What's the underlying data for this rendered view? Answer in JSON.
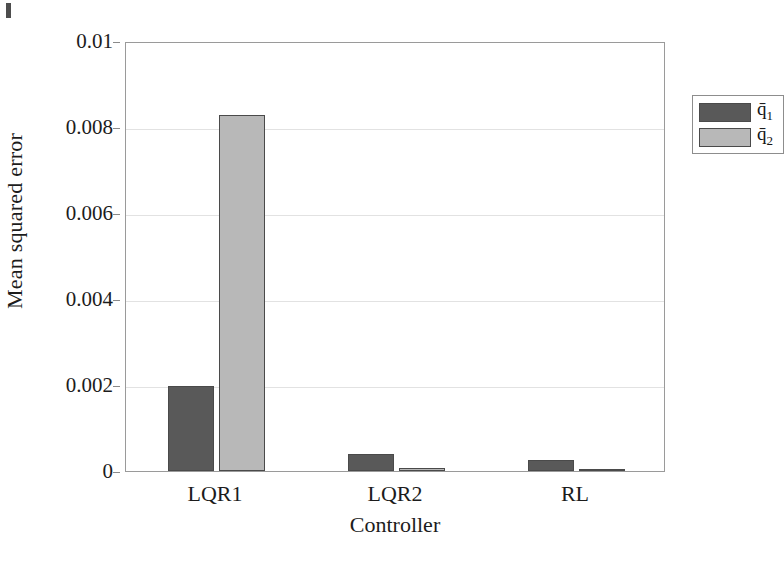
{
  "chart_data": {
    "type": "bar",
    "title": "",
    "subtitle": "",
    "xlabel": "Controller",
    "ylabel": "Mean squared error",
    "categories": [
      "LQR1",
      "LQR2",
      "RL"
    ],
    "series": [
      {
        "name": "q̅1",
        "label_base": "q̄",
        "label_sub": "1",
        "color": "#595959",
        "values": [
          0.00198,
          0.0004,
          0.00025
        ]
      },
      {
        "name": "q̅2",
        "label_base": "q̄",
        "label_sub": "2",
        "color": "#b8b8b8",
        "values": [
          0.00828,
          8e-05,
          5e-05
        ]
      }
    ],
    "ylim": [
      0,
      0.01
    ],
    "xlim_note": "categorical",
    "yticks": [
      0,
      0.002,
      0.004,
      0.006,
      0.008,
      0.01
    ],
    "ytick_labels": [
      "0",
      "0.002",
      "0.004",
      "0.006",
      "0.008",
      "0.01"
    ],
    "grid": true,
    "grid_axis": "y",
    "legend_position": "top-right",
    "legend_entries": [
      "q̄1",
      "q̄2"
    ]
  },
  "axes": {
    "y_title": "Mean squared error",
    "x_title": "Controller",
    "y_tick_labels": [
      "0",
      "0.002",
      "0.004",
      "0.006",
      "0.008",
      "0.01"
    ],
    "x_tick_labels": [
      "LQR1",
      "LQR2",
      "RL"
    ]
  },
  "legend": {
    "items": [
      {
        "base": "q̄",
        "sub": "1",
        "color": "#595959"
      },
      {
        "base": "q̄",
        "sub": "2",
        "color": "#b8b8b8"
      }
    ]
  },
  "colors": {
    "series_1": "#595959",
    "series_2": "#b8b8b8",
    "axis": "#9a9a9a",
    "grid": "#e2e2e2",
    "text": "#1c1c1c",
    "background": "#ffffff"
  }
}
